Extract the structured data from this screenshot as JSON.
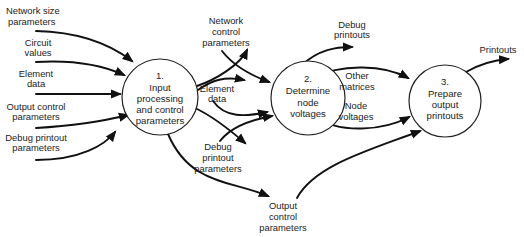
{
  "colors": {
    "line": "#111111",
    "text": "#222222",
    "background": "#ffffff"
  },
  "processes": [
    {
      "id": "p1",
      "number": "1.",
      "lines": [
        "Input",
        "processing",
        "and control",
        "parameters"
      ]
    },
    {
      "id": "p2",
      "number": "2.",
      "lines": [
        "Determine",
        "node",
        "voltages"
      ]
    },
    {
      "id": "p3",
      "number": "3.",
      "lines": [
        "Prepare",
        "output",
        "printouts"
      ]
    }
  ],
  "flows": [
    {
      "id": "network-size-parameters",
      "label": [
        "Network size",
        "parameters"
      ],
      "from": "external",
      "to": "p1"
    },
    {
      "id": "circuit-values",
      "label": [
        "Circuit",
        "values"
      ],
      "from": "external",
      "to": "p1"
    },
    {
      "id": "element-data-in",
      "label": [
        "Element",
        "data"
      ],
      "from": "external",
      "to": "p1"
    },
    {
      "id": "output-control-parameters-in",
      "label": [
        "Output control",
        "parameters"
      ],
      "from": "external",
      "to": "p1"
    },
    {
      "id": "debug-printout-parameters-in",
      "label": [
        "Debug printout",
        "parameters"
      ],
      "from": "external",
      "to": "p1"
    },
    {
      "id": "network-control-parameters",
      "label": [
        "Network",
        "control",
        "parameters"
      ],
      "from": "p1",
      "to": "p2"
    },
    {
      "id": "element-data-mid",
      "label": [
        "Element",
        "data"
      ],
      "from": "p1",
      "to": "p2"
    },
    {
      "id": "debug-printout-parameters-mid",
      "label": [
        "Debug",
        "printout",
        "parameters"
      ],
      "from": "p1",
      "to": "p2"
    },
    {
      "id": "output-control-parameters-mid",
      "label": [
        "Output",
        "control",
        "parameters"
      ],
      "from": "p1",
      "to": "p3"
    },
    {
      "id": "debug-printouts",
      "label": [
        "Debug",
        "printouts"
      ],
      "from": "p2",
      "to": "external"
    },
    {
      "id": "other-matrices",
      "label": [
        "Other",
        "matrices"
      ],
      "from": "p2",
      "to": "p3"
    },
    {
      "id": "node-voltages",
      "label": [
        "Node",
        "voltages"
      ],
      "from": "p2",
      "to": "p3"
    },
    {
      "id": "printouts",
      "label": [
        "Printouts"
      ],
      "from": "p3",
      "to": "external"
    }
  ]
}
